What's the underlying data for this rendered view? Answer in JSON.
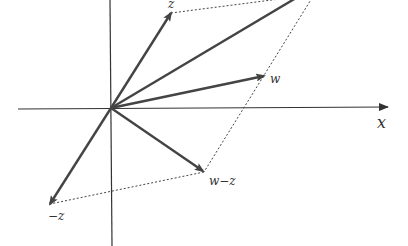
{
  "diagram": {
    "title": "",
    "colors": {
      "axis": "#333333",
      "vector": "#444444",
      "dotted": "#444444",
      "background": "#ffffff"
    },
    "axes": {
      "x_label": "x"
    },
    "vectors": [
      {
        "id": "z",
        "label": "z"
      },
      {
        "id": "w_plus_z",
        "label": ""
      },
      {
        "id": "w",
        "label": "w"
      },
      {
        "id": "w_minus_z",
        "label": "w−z"
      },
      {
        "id": "neg_z",
        "label": "−z"
      }
    ]
  }
}
